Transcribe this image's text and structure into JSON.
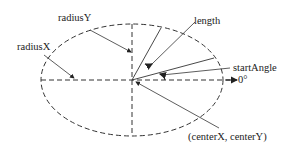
{
  "diagram": {
    "type": "ellipse-arc-parameters",
    "labels": {
      "radiusY": "radiusY",
      "radiusX": "radiusX",
      "length": "length",
      "startAngle": "startAngle",
      "zeroDeg": "0°",
      "center": "(centerX, centerY)"
    },
    "colors": {
      "stroke": "#222222",
      "background": "#ffffff"
    }
  }
}
